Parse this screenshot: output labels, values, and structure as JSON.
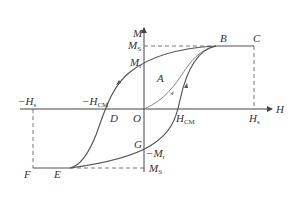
{
  "diagram": {
    "type": "magnetic-hysteresis-loop",
    "axes": {
      "x_label": "H",
      "y_label": "M",
      "origin_label": "O"
    },
    "points": {
      "A": "A",
      "B": "B",
      "C": "C",
      "D": "D",
      "E": "E",
      "F": "F",
      "G": "G"
    },
    "tick_labels": {
      "ms_pos": {
        "main": "M",
        "sub": "S"
      },
      "mr_pos": {
        "main": "M",
        "sub": "r"
      },
      "mr_neg": {
        "prefix": "−",
        "main": "M",
        "sub": "r"
      },
      "ms_neg": {
        "main": "M",
        "sub": "S"
      },
      "hs_pos": {
        "main": "H",
        "sub": "s"
      },
      "hs_neg": {
        "prefix": "−",
        "main": "H",
        "sub": "s"
      },
      "hcm_pos": {
        "main": "H",
        "sub": "CM"
      },
      "hcm_neg": {
        "prefix": "−",
        "main": "H",
        "sub": "CM"
      }
    },
    "colors": {
      "curve": "#555555",
      "axis": "#444444",
      "dashed": "#555555",
      "initial_curve": "#888888"
    }
  }
}
